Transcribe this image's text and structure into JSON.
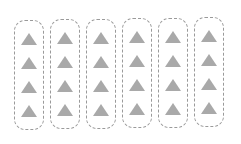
{
  "diagram": {
    "groups": [
      {
        "items": [
          "triangle",
          "triangle",
          "triangle",
          "triangle"
        ]
      },
      {
        "items": [
          "triangle",
          "triangle",
          "triangle",
          "triangle"
        ]
      },
      {
        "items": [
          "triangle",
          "triangle",
          "triangle",
          "triangle"
        ]
      },
      {
        "items": [
          "triangle",
          "triangle",
          "triangle",
          "triangle"
        ]
      },
      {
        "items": [
          "triangle",
          "triangle",
          "triangle",
          "triangle"
        ]
      },
      {
        "items": [
          "triangle",
          "triangle",
          "triangle",
          "triangle"
        ]
      }
    ],
    "group_count": 6,
    "items_per_group": 4,
    "colors": {
      "triangle": "#a9a9a9",
      "border": "#9a9a9a",
      "background": "#ffffff"
    }
  }
}
